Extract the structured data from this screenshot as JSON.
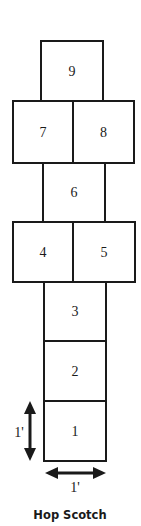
{
  "title": "Hop Scotch",
  "squares": [
    {
      "label": "1",
      "x": 44,
      "y": 401,
      "w": 62,
      "h": 60
    },
    {
      "label": "2",
      "x": 44,
      "y": 341,
      "w": 62,
      "h": 60
    },
    {
      "label": "3",
      "x": 44,
      "y": 282,
      "w": 62,
      "h": 59
    },
    {
      "label": "4",
      "x": 13,
      "y": 222,
      "w": 60,
      "h": 60
    },
    {
      "label": "5",
      "x": 73,
      "y": 222,
      "w": 62,
      "h": 60
    },
    {
      "label": "6",
      "x": 43,
      "y": 163,
      "w": 62,
      "h": 59
    },
    {
      "label": "7",
      "x": 13,
      "y": 101,
      "w": 60,
      "h": 62
    },
    {
      "label": "8",
      "x": 73,
      "y": 101,
      "w": 61,
      "h": 62
    },
    {
      "label": "9",
      "x": 41,
      "y": 41,
      "w": 62,
      "h": 60
    }
  ],
  "dimensions": {
    "height_label": "1'",
    "width_label": "1'"
  },
  "colors": {
    "stroke": "#1a1a1a",
    "background": "#ffffff"
  }
}
